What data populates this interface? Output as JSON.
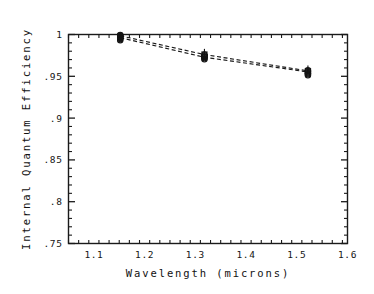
{
  "chart_data": {
    "type": "scatter",
    "title": "",
    "xlabel": "Wavelength (microns)",
    "ylabel": "Internal Quantum Efficiency",
    "xlim": [
      1.05,
      1.6
    ],
    "ylim": [
      0.75,
      1.0
    ],
    "grid": false,
    "legend": null,
    "xticks": [
      1.1,
      1.2,
      1.3,
      1.4,
      1.5,
      1.6
    ],
    "xticklabels": [
      "1.1",
      "1.2",
      "1.3",
      "1.4",
      "1.5",
      "1.6"
    ],
    "xminor_step": 0.02,
    "yticks": [
      0.75,
      0.8,
      0.85,
      0.9,
      0.95,
      1.0
    ],
    "yticklabels": [
      ".75",
      ".8",
      ".85",
      ".9",
      ".95",
      "1"
    ],
    "yminor_step": 0.01,
    "series": [
      {
        "name": "measured-circles",
        "marker": "circle",
        "points": [
          {
            "x": 1.152,
            "y": 0.9995
          },
          {
            "x": 1.152,
            "y": 0.9988
          },
          {
            "x": 1.152,
            "y": 0.9978
          },
          {
            "x": 1.152,
            "y": 0.9968
          },
          {
            "x": 1.152,
            "y": 0.9957
          },
          {
            "x": 1.152,
            "y": 0.9946
          },
          {
            "x": 1.152,
            "y": 0.9932
          },
          {
            "x": 1.318,
            "y": 0.9762
          },
          {
            "x": 1.318,
            "y": 0.975
          },
          {
            "x": 1.318,
            "y": 0.974
          },
          {
            "x": 1.318,
            "y": 0.9728
          },
          {
            "x": 1.318,
            "y": 0.9716
          },
          {
            "x": 1.318,
            "y": 0.9704
          },
          {
            "x": 1.522,
            "y": 0.9572
          },
          {
            "x": 1.522,
            "y": 0.956
          },
          {
            "x": 1.522,
            "y": 0.9548
          },
          {
            "x": 1.522,
            "y": 0.9536
          },
          {
            "x": 1.522,
            "y": 0.9524
          },
          {
            "x": 1.522,
            "y": 0.9512
          }
        ]
      },
      {
        "name": "measured-plus",
        "marker": "plus",
        "points": [
          {
            "x": 1.152,
            "y": 0.9992
          },
          {
            "x": 1.152,
            "y": 0.9974
          },
          {
            "x": 1.152,
            "y": 0.9952
          },
          {
            "x": 1.318,
            "y": 0.979
          },
          {
            "x": 1.318,
            "y": 0.9758
          },
          {
            "x": 1.318,
            "y": 0.9734
          },
          {
            "x": 1.522,
            "y": 0.959
          },
          {
            "x": 1.522,
            "y": 0.9562
          },
          {
            "x": 1.522,
            "y": 0.9534
          }
        ]
      }
    ],
    "fit_lines": [
      {
        "name": "fit-upper",
        "style": "dashed",
        "x": [
          1.152,
          1.318,
          1.522
        ],
        "y": [
          0.9985,
          0.976,
          0.9565
        ]
      },
      {
        "name": "fit-lower",
        "style": "dashed",
        "x": [
          1.152,
          1.318,
          1.522
        ],
        "y": [
          0.9962,
          0.9728,
          0.9552
        ]
      }
    ]
  }
}
